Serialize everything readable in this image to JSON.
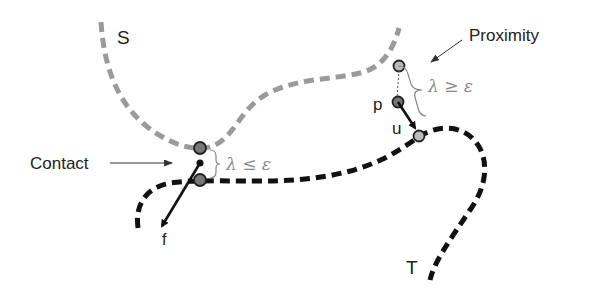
{
  "diagram": {
    "curves": {
      "S": {
        "label": "S",
        "color": "#9a9a9a",
        "style": "dashed-gray"
      },
      "T": {
        "label": "T",
        "color": "#111111",
        "style": "dashed-black"
      }
    },
    "annotations": {
      "contact": "Contact",
      "proximity": "Proximity",
      "contact_condition": "λ ≤ ε",
      "proximity_condition": "λ ≥ ε"
    },
    "vectors": {
      "force": "f",
      "displacement": "u"
    },
    "points": {
      "p": "p"
    },
    "colors": {
      "point_fill": "#777777",
      "point_fill_light": "#bbbbbb",
      "math_text": "#888888"
    }
  }
}
